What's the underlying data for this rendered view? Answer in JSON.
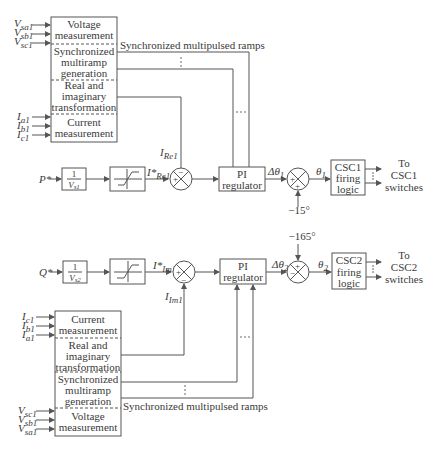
{
  "top": {
    "measure_block": {
      "sections": [
        [
          "Voltage",
          "measurement"
        ],
        [
          "Synchronized",
          "multiramp",
          "generation"
        ],
        [
          "Real and",
          "imaginary",
          "transformation"
        ],
        [
          "Current",
          "measurement"
        ]
      ]
    },
    "voltage_inputs": [
      {
        "base": "V",
        "sub": "sa1"
      },
      {
        "base": "V",
        "sub": "sb1"
      },
      {
        "base": "V",
        "sub": "sc1"
      }
    ],
    "current_inputs": [
      {
        "base": "I",
        "sub": "a1"
      },
      {
        "base": "I",
        "sub": "b1"
      },
      {
        "base": "I",
        "sub": "c1"
      }
    ],
    "ramps_label": "Synchronized multipulsed ramps",
    "input_label": "P*",
    "gain_block": {
      "num": "1",
      "den": "V",
      "den_sub": "s1"
    },
    "ref_label": {
      "base": "I*",
      "sub": "Re1"
    },
    "feedback_label": {
      "base": "I",
      "sub": "Re1"
    },
    "sum1_signs": [
      "+",
      "−"
    ],
    "pi_block": [
      "PI",
      "regulator"
    ],
    "delta_label": {
      "base": "Δθ",
      "sub": "1"
    },
    "sum2_signs": [
      "+",
      "+"
    ],
    "offset": "−15°",
    "theta_label": {
      "base": "θ",
      "sub": "1"
    },
    "firing_block": [
      "CSC1",
      "firing",
      "logic"
    ],
    "output_label": [
      "To",
      "CSC1",
      "switches"
    ]
  },
  "bottom": {
    "measure_block": {
      "sections": [
        [
          "Current",
          "measurement"
        ],
        [
          "Real and",
          "imaginary",
          "transformation"
        ],
        [
          "Synchronized",
          "multiramp",
          "generation"
        ],
        [
          "Voltage",
          "measurement"
        ]
      ]
    },
    "current_inputs": [
      {
        "base": "I",
        "sub": "c1"
      },
      {
        "base": "I",
        "sub": "b1"
      },
      {
        "base": "I",
        "sub": "a1"
      }
    ],
    "voltage_inputs": [
      {
        "base": "V",
        "sub": "sc1"
      },
      {
        "base": "V",
        "sub": "sb1"
      },
      {
        "base": "V",
        "sub": "sa1"
      }
    ],
    "ramps_label": "Synchronized multipulsed ramps",
    "input_label": "Q*",
    "gain_block": {
      "num": "1",
      "den": "V",
      "den_sub": "s2"
    },
    "ref_label": {
      "base": "I*",
      "sub": "Im1"
    },
    "feedback_label": {
      "base": "I",
      "sub": "Im1"
    },
    "sum1_signs": [
      "+",
      "−"
    ],
    "pi_block": [
      "PI",
      "regulator"
    ],
    "delta_label": {
      "base": "Δθ",
      "sub": "2"
    },
    "sum2_signs": [
      "+",
      "−"
    ],
    "offset": "−165°",
    "theta_label": {
      "base": "θ",
      "sub": "2"
    },
    "firing_block": [
      "CSC2",
      "firing",
      "logic"
    ],
    "output_label": [
      "To",
      "CSC2",
      "switches"
    ]
  }
}
